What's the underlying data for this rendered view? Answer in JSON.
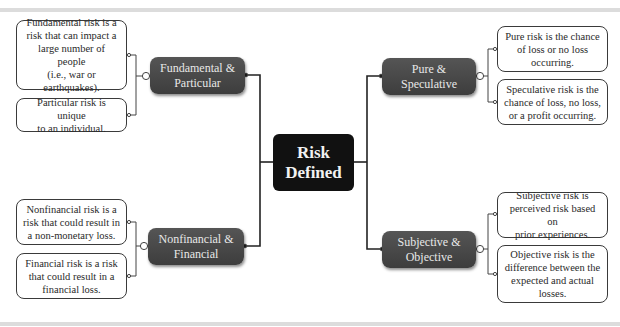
{
  "center": {
    "title": "Risk\nDefined"
  },
  "branches": [
    {
      "id": "fundamental-particular",
      "title": "Fundamental &\nParticular",
      "leaves": [
        "Fundamental risk is a\nrisk that can impact a\nlarge number of people\n(i.e., war or\nearthquakes).",
        "Particular risk is unique\nto an individual."
      ]
    },
    {
      "id": "nonfinancial-financial",
      "title": "Nonfinancial &\nFinancial",
      "leaves": [
        "Nonfinancial risk is a\nrisk that could result in\na non-monetary loss.",
        "Financial risk is a risk\nthat could result in a\nfinancial loss."
      ]
    },
    {
      "id": "pure-speculative",
      "title": "Pure &\nSpeculative",
      "leaves": [
        "Pure risk is the chance\nof loss or no loss\noccurring.",
        "Speculative risk is the\nchance of loss, no loss,\nor a profit occurring."
      ]
    },
    {
      "id": "subjective-objective",
      "title": "Subjective &\nObjective",
      "leaves": [
        "Subjective risk is\nperceived risk based on\nprior experiences.",
        "Objective risk is the\ndifference between the\nexpected and actual\nlosses."
      ]
    }
  ],
  "colors": {
    "center_bg": "#111111",
    "branch_bg": "#4a4a4a",
    "branch_text": "#e8e8e8",
    "leaf_border": "#3a3a3a",
    "rule": "#dcdcdc"
  }
}
